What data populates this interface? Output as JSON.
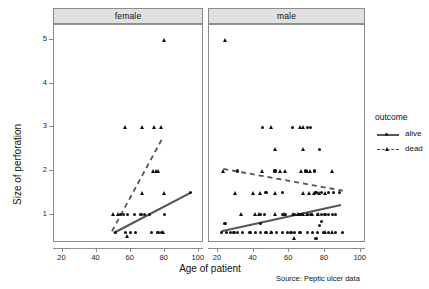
{
  "chart_data": {
    "type": "scatter",
    "title": "",
    "xlabel": "Age of patient",
    "ylabel": "Size of perforation",
    "xlim": [
      15,
      103
    ],
    "ylim": [
      0.35,
      5.35
    ],
    "xticks": [
      20,
      40,
      60,
      80,
      100
    ],
    "yticks": [
      1,
      2,
      3,
      4,
      5
    ],
    "grid": false,
    "facet_variable": "sex",
    "legend": {
      "title": "outcome",
      "position": "right",
      "entries": [
        {
          "label": "alive",
          "marker": "circle",
          "line": "solid",
          "color": "#111111"
        },
        {
          "label": "dead",
          "marker": "triangle",
          "line": "dashed",
          "color": "#111111"
        }
      ]
    },
    "caption": "Source: Peptic ulcer data",
    "panels": [
      {
        "label": "female",
        "series": [
          {
            "name": "alive",
            "marker": "circle",
            "points": [
              [
                51,
                0.6
              ],
              [
                57,
                0.6
              ],
              [
                58,
                1.0
              ],
              [
                62,
                1.0
              ],
              [
                66,
                1.0
              ],
              [
                71,
                1.0
              ],
              [
                72,
                0.6
              ],
              [
                76,
                0.6
              ],
              [
                78,
                0.6
              ],
              [
                54,
                1.0
              ],
              [
                56,
                1.0
              ],
              [
                63,
                0.6
              ],
              [
                80,
                1.0
              ],
              [
                68,
                1.0
              ],
              [
                60,
                0.6
              ],
              [
                95,
                1.5
              ]
            ],
            "trend": {
              "type": "line",
              "style": "solid",
              "x": [
                50,
                95
              ],
              "y": [
                0.58,
                1.5
              ]
            }
          },
          {
            "name": "dead",
            "marker": "triangle",
            "points": [
              [
                80,
                5.0
              ],
              [
                57,
                3.0
              ],
              [
                67,
                3.0
              ],
              [
                74,
                3.0
              ],
              [
                78,
                3.0
              ],
              [
                73,
                2.0
              ],
              [
                75,
                2.0
              ],
              [
                76,
                2.0
              ],
              [
                67,
                1.5
              ],
              [
                80,
                1.5
              ],
              [
                50,
                1.0
              ],
              [
                58,
                0.5
              ],
              [
                79,
                0.6
              ],
              [
                53,
                1.0
              ]
            ],
            "trend": {
              "type": "line",
              "style": "dashed",
              "x": [
                49,
                79
              ],
              "y": [
                0.62,
                2.78
              ]
            }
          }
        ]
      },
      {
        "label": "male",
        "series": [
          {
            "name": "alive",
            "marker": "circle",
            "points": [
              [
                45,
                3.0
              ],
              [
                62,
                3.0
              ],
              [
                70,
                3.0
              ],
              [
                72,
                3.0
              ],
              [
                77,
                2.5
              ],
              [
                52,
                2.0
              ],
              [
                69,
                2.0
              ],
              [
                74,
                2.0
              ],
              [
                31,
                2.0
              ],
              [
                47,
                1.5
              ],
              [
                56,
                1.5
              ],
              [
                75,
                1.5
              ],
              [
                78,
                1.5
              ],
              [
                82,
                1.5
              ],
              [
                85,
                1.5
              ],
              [
                88,
                1.5
              ],
              [
                44,
                1.0
              ],
              [
                46,
                1.0
              ],
              [
                56,
                1.0
              ],
              [
                58,
                1.0
              ],
              [
                63,
                1.0
              ],
              [
                66,
                1.0
              ],
              [
                70,
                1.0
              ],
              [
                72,
                1.0
              ],
              [
                76,
                1.0
              ],
              [
                78,
                1.0
              ],
              [
                80,
                1.0
              ],
              [
                82,
                1.0
              ],
              [
                84,
                1.0
              ],
              [
                86,
                1.0
              ],
              [
                22,
                0.6
              ],
              [
                25,
                0.6
              ],
              [
                27,
                0.6
              ],
              [
                29,
                0.6
              ],
              [
                31,
                0.6
              ],
              [
                34,
                0.6
              ],
              [
                38,
                0.6
              ],
              [
                41,
                0.6
              ],
              [
                44,
                0.6
              ],
              [
                47,
                0.6
              ],
              [
                50,
                0.6
              ],
              [
                53,
                0.6
              ],
              [
                56,
                0.6
              ],
              [
                59,
                0.6
              ],
              [
                61,
                0.6
              ],
              [
                63,
                0.6
              ],
              [
                66,
                0.6
              ],
              [
                70,
                0.6
              ],
              [
                73,
                0.6
              ],
              [
                76,
                0.6
              ],
              [
                79,
                0.6
              ],
              [
                82,
                0.6
              ],
              [
                86,
                0.6
              ],
              [
                90,
                0.6
              ],
              [
                24,
                0.8
              ],
              [
                77,
                0.75
              ],
              [
                78,
                0.85
              ],
              [
                44,
                0.8
              ],
              [
                75,
                0.45
              ]
            ],
            "trend": {
              "type": "line",
              "style": "solid",
              "x": [
                22,
                89
              ],
              "y": [
                0.62,
                1.22
              ]
            }
          },
          {
            "name": "dead",
            "marker": "triangle",
            "points": [
              [
                24,
                5.0
              ],
              [
                50,
                3.0
              ],
              [
                66,
                3.0
              ],
              [
                68,
                3.0
              ],
              [
                52,
                2.5
              ],
              [
                68,
                2.5
              ],
              [
                23,
                2.0
              ],
              [
                45,
                2.0
              ],
              [
                55,
                2.0
              ],
              [
                58,
                2.0
              ],
              [
                67,
                2.0
              ],
              [
                70,
                2.0
              ],
              [
                72,
                2.0
              ],
              [
                84,
                2.0
              ],
              [
                30,
                1.5
              ],
              [
                40,
                1.5
              ],
              [
                44,
                1.5
              ],
              [
                52,
                1.5
              ],
              [
                68,
                1.5
              ],
              [
                71,
                1.5
              ],
              [
                74,
                1.5
              ],
              [
                77,
                1.5
              ],
              [
                80,
                1.5
              ],
              [
                33,
                1.0
              ],
              [
                41,
                1.0
              ],
              [
                43,
                1.0
              ],
              [
                52,
                1.0
              ],
              [
                57,
                1.0
              ],
              [
                62,
                1.0
              ],
              [
                65,
                1.0
              ],
              [
                68,
                1.0
              ],
              [
                70,
                1.0
              ],
              [
                73,
                1.0
              ],
              [
                76,
                1.0
              ],
              [
                50,
                0.6
              ],
              [
                63,
                0.45
              ],
              [
                80,
                0.6
              ],
              [
                84,
                0.6
              ]
            ],
            "trend": {
              "type": "line",
              "style": "dashed",
              "x": [
                23,
                90
              ],
              "y": [
                2.05,
                1.55
              ]
            }
          }
        ]
      }
    ]
  },
  "axes": {
    "ylabel": "Size of perforation",
    "xlabel": "Age of patient",
    "yticks": [
      "1",
      "2",
      "3",
      "4",
      "5"
    ],
    "xticks": [
      "20",
      "40",
      "60",
      "80",
      "100"
    ]
  },
  "panels": {
    "female_label": "female",
    "male_label": "male"
  },
  "legend": {
    "title": "outcome",
    "alive_label": "alive",
    "dead_label": "dead"
  },
  "footer": {
    "source": "Source: Peptic ulcer data"
  },
  "colors": {
    "mark": "#111111",
    "trend": "#555555",
    "strip_bg": "#e0e0e0",
    "border": "#8c8c8c"
  }
}
